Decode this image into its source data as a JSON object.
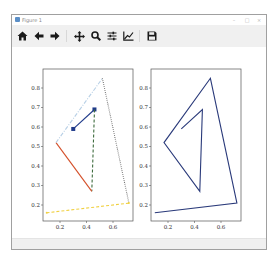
{
  "window": {
    "title": "Figure 1",
    "controls": [
      "minimize",
      "maximize",
      "close"
    ]
  },
  "toolbar": {
    "buttons": [
      {
        "name": "home-button",
        "icon": "home-icon",
        "tooltip": "Reset original view"
      },
      {
        "name": "back-button",
        "icon": "arrow-left-icon",
        "tooltip": "Back"
      },
      {
        "name": "forward-button",
        "icon": "arrow-right-icon",
        "tooltip": "Forward"
      },
      {
        "name": "pan-button",
        "icon": "move-icon",
        "tooltip": "Pan"
      },
      {
        "name": "zoom-button",
        "icon": "magnifier-icon",
        "tooltip": "Zoom"
      },
      {
        "name": "subplots-button",
        "icon": "sliders-icon",
        "tooltip": "Configure subplots"
      },
      {
        "name": "edit-axes-button",
        "icon": "chart-line-icon",
        "tooltip": "Edit axis"
      },
      {
        "name": "save-button",
        "icon": "floppy-disk-icon",
        "tooltip": "Save"
      }
    ]
  },
  "chart_data": [
    {
      "type": "line",
      "title": "",
      "xlabel": "",
      "ylabel": "",
      "xlim": [
        0.07,
        0.75
      ],
      "ylim": [
        0.12,
        0.9
      ],
      "xticks": [
        0.2,
        0.4,
        0.6
      ],
      "xtick_labels": [
        "0.2",
        "0.4",
        "0.6"
      ],
      "yticks": [
        0.2,
        0.3,
        0.4,
        0.5,
        0.6,
        0.7,
        0.8
      ],
      "ytick_labels": [
        "0.2",
        "0.3",
        "0.4",
        "0.5",
        "0.6",
        "0.7",
        "0.8"
      ],
      "grid": false,
      "legend": null,
      "series": [
        {
          "name": "seg1",
          "color": "#1f3a8a",
          "style": "solid",
          "marker": "square",
          "x": [
            0.3,
            0.46
          ],
          "y": [
            0.59,
            0.69
          ]
        },
        {
          "name": "seg2",
          "color": "#3d6b3d",
          "style": "dashed",
          "marker": "none",
          "x": [
            0.46,
            0.44
          ],
          "y": [
            0.69,
            0.27
          ]
        },
        {
          "name": "seg3",
          "color": "#d4502a",
          "style": "solid",
          "marker": "none",
          "x": [
            0.44,
            0.17
          ],
          "y": [
            0.27,
            0.52
          ]
        },
        {
          "name": "seg4",
          "color": "#b8d0e6",
          "style": "dashdot",
          "marker": "none",
          "x": [
            0.17,
            0.52
          ],
          "y": [
            0.52,
            0.85
          ]
        },
        {
          "name": "seg5",
          "color": "#6a6a6a",
          "style": "dotted",
          "marker": "none",
          "x": [
            0.52,
            0.72
          ],
          "y": [
            0.85,
            0.21
          ]
        },
        {
          "name": "seg6",
          "color": "#f0d040",
          "style": "dashed",
          "marker": "point",
          "x": [
            0.72,
            0.1
          ],
          "y": [
            0.21,
            0.16
          ]
        }
      ]
    },
    {
      "type": "line",
      "title": "",
      "xlabel": "",
      "ylabel": "",
      "xlim": [
        0.07,
        0.75
      ],
      "ylim": [
        0.12,
        0.9
      ],
      "xticks": [
        0.2,
        0.4,
        0.6
      ],
      "xtick_labels": [
        "0.2",
        "0.4",
        "0.6"
      ],
      "yticks": [
        0.2,
        0.3,
        0.4,
        0.5,
        0.6,
        0.7,
        0.8
      ],
      "ytick_labels": [
        "0.2",
        "0.3",
        "0.4",
        "0.5",
        "0.6",
        "0.7",
        "0.8"
      ],
      "grid": false,
      "legend": null,
      "series": [
        {
          "name": "path",
          "color": "#2a3a7a",
          "style": "solid",
          "marker": "none",
          "x": [
            0.3,
            0.46,
            0.44,
            0.17,
            0.52,
            0.72,
            0.1
          ],
          "y": [
            0.59,
            0.69,
            0.27,
            0.52,
            0.85,
            0.21,
            0.16
          ]
        }
      ]
    }
  ]
}
